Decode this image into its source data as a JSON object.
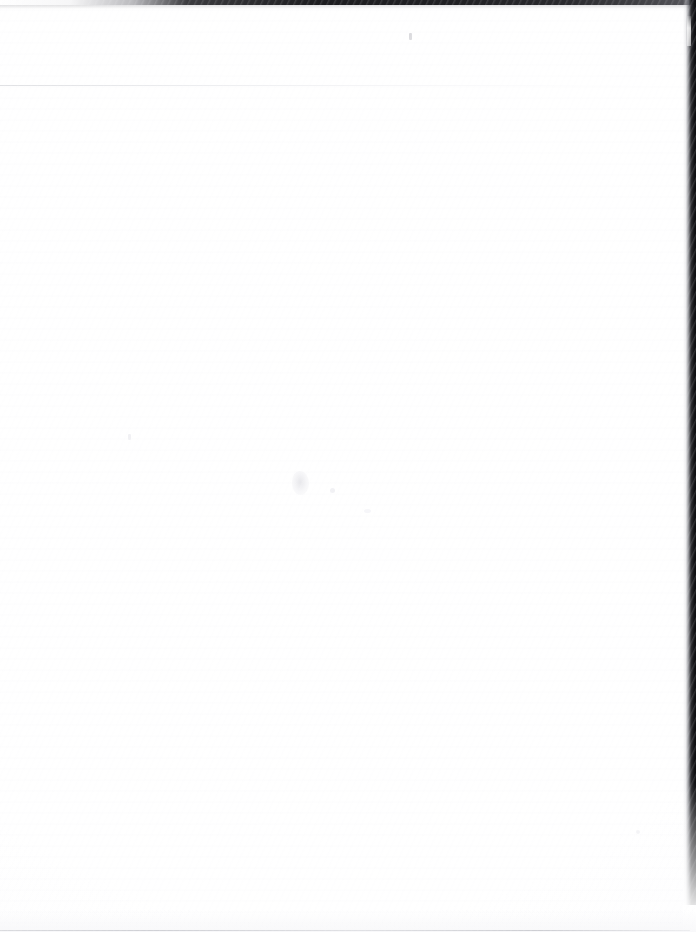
{
  "page": {
    "kind": "scanned-blank-page",
    "width": 696,
    "height": 932,
    "visible_text": "",
    "description": "Scan of a blank page. No text, headings, figures, tables or interface elements are present in the pixels.",
    "background_color": "#ffffff",
    "paper_tone": "#fdfdfe"
  },
  "artifacts": {
    "top_edge_band": {
      "name": "top-edge-band",
      "color": "#161619",
      "height_px": 5,
      "note": "dark horizontal band along the very top, fading out toward the left"
    },
    "right_edge_strip": {
      "name": "right-edge-strip",
      "color": "#0c0c0f",
      "width_px": 13,
      "note": "black vertical strip along the right edge, narrowing and ending before the bottom"
    },
    "right_edge_notch": {
      "name": "right-edge-notch",
      "color": "#ffffff",
      "note": "small light notch interrupting the right edge strip near the top"
    },
    "top_hairline": {
      "name": "top-hairline",
      "color": "#dedfe2",
      "note": "faint gray horizontal rule near the upper-left"
    },
    "bottom_hairline": {
      "name": "bottom-hairline",
      "color": "#cdced3",
      "note": "faint gray line along the very bottom edge"
    },
    "specks": [
      {
        "name": "speck-upper",
        "color": "#a0a0a8",
        "note": "tiny speck in the upper area"
      },
      {
        "name": "smudge-center",
        "color": "#e4e4e8",
        "note": "very faint smudge near the vertical middle"
      },
      {
        "name": "smudge-dot",
        "color": "#eeeef2",
        "note": "faint dot beside the center smudge"
      },
      {
        "name": "smudge-faint-low",
        "color": "#f4f4f7",
        "note": "very faint mark below the center smudge"
      },
      {
        "name": "speck-lower-left",
        "color": "#f0f0f3",
        "note": "faint speck toward the left"
      },
      {
        "name": "speck-lower-right",
        "color": "#f2f2f5",
        "note": "faint speck toward the lower right"
      }
    ]
  }
}
